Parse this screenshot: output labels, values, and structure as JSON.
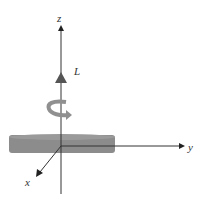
{
  "diagram": {
    "type": "angular-momentum-disk",
    "axes": {
      "z_label": "z",
      "y_label": "y",
      "x_label": "x"
    },
    "vector_label": "L",
    "colors": {
      "axis": "#333333",
      "disk": "#8a8a8a",
      "disk_edge": "#6e6e6e",
      "vector": "#555555",
      "rotation_arrow": "#8f8f8f"
    }
  }
}
